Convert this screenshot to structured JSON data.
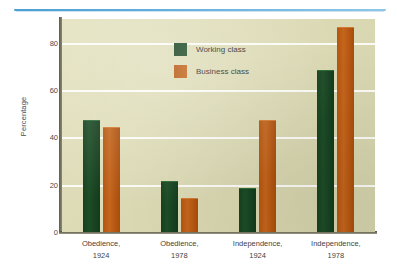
{
  "chart_data": {
    "type": "bar",
    "title": "",
    "xlabel": "",
    "ylabel": "Percentage",
    "ylim": [
      0,
      90
    ],
    "yticks": [
      0,
      20,
      40,
      60,
      80
    ],
    "ytick_labels": [
      "0",
      "20",
      "40",
      "60",
      "80"
    ],
    "minor_ticks": [
      10,
      30,
      50,
      70,
      90
    ],
    "grid": true,
    "gridlines_at": [
      20,
      40,
      60,
      80
    ],
    "legend_position": "top-left-inside",
    "categories": [
      "Obedience, 1924",
      "Obedience, 1978",
      "Independence, 1924",
      "Independence, 1978"
    ],
    "category_lines": [
      [
        "Obedience,",
        "1924"
      ],
      [
        "Obedience,",
        "1978"
      ],
      [
        "Independence,",
        "1924"
      ],
      [
        "Independence,",
        "1978"
      ]
    ],
    "series": [
      {
        "name": "Working class",
        "color": "#1a4a23",
        "values": [
          47,
          21,
          18,
          68
        ]
      },
      {
        "name": "Business class",
        "color": "#bf5e14",
        "values": [
          44,
          14,
          47,
          86
        ]
      }
    ],
    "colors": {
      "working_class": "#1a4a23",
      "business_class": "#bf5e14",
      "plot_background": "#dedcb2",
      "gridline": "#ffffff",
      "axis": "#5d5c4a",
      "top_rule": "#5aa6d8",
      "page_background": "#ffffff"
    }
  },
  "legend": {
    "items": [
      {
        "label": "Working class"
      },
      {
        "label": "Business class"
      }
    ]
  },
  "axis": {
    "y_title": "Percentage"
  }
}
